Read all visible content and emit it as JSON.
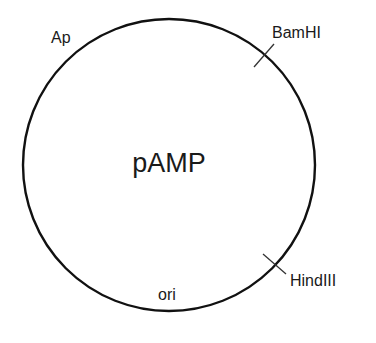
{
  "plasmid": {
    "name": "pAMP",
    "features": [
      {
        "label": "Ap",
        "type": "gene"
      },
      {
        "label": "ori",
        "type": "origin"
      }
    ],
    "restriction_sites": [
      {
        "label": "BamHI"
      },
      {
        "label": "HindIII"
      }
    ]
  },
  "colors": {
    "line": "#111111",
    "text": "#1a1a1a",
    "background": "#ffffff"
  }
}
